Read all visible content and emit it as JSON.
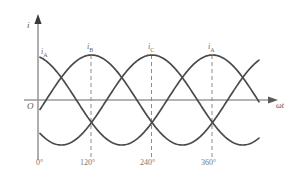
{
  "figure": {
    "title": "",
    "axes": {
      "y_axis_label": "i",
      "x_axis_label": "ωt",
      "origin_label": "O"
    },
    "curve_labels": [
      {
        "text": "i",
        "sub": "A"
      },
      {
        "text": "i",
        "sub": "B"
      },
      {
        "text": "i",
        "sub": "C"
      },
      {
        "text": "i",
        "sub": "A"
      }
    ],
    "tick_labels": [
      "0°",
      "120°",
      "240°",
      "360°"
    ],
    "colors": {
      "curve": "#4a4a4a",
      "axis": "#9a9a9a",
      "dashed": "#8c8c8c",
      "text": "#6a6a6a",
      "background": "#ffffff"
    }
  },
  "chart_data": {
    "type": "line",
    "xlabel": "ωt",
    "ylabel": "i",
    "xlim": [
      -20,
      420
    ],
    "ylim": [
      -1.15,
      1.15
    ],
    "grid": false,
    "legend": "inline-curve-labels",
    "x_ticks": [
      0,
      120,
      240,
      360
    ],
    "x_tick_labels": [
      "0°",
      "120°",
      "240°",
      "360°"
    ],
    "amplitude": 1.0,
    "period_deg": 360,
    "series": [
      {
        "name": "i_A",
        "phase_deg": 90,
        "peak_at_deg": [
          0,
          360
        ],
        "values_desc": "sin(wt + 90)"
      },
      {
        "name": "i_B",
        "phase_deg": -30,
        "peak_at_deg": [
          120
        ],
        "values_desc": "sin(wt - 30)"
      },
      {
        "name": "i_C",
        "phase_deg": -150,
        "peak_at_deg": [
          240
        ],
        "values_desc": "sin(wt - 150)"
      }
    ],
    "annotations": [
      {
        "label": "i_A",
        "x_deg": 0,
        "y": 0.78
      },
      {
        "label": "i_B",
        "x_deg": 120,
        "y": 1.0
      },
      {
        "label": "i_C",
        "x_deg": 240,
        "y": 1.0
      },
      {
        "label": "i_A",
        "x_deg": 360,
        "y": 1.0
      }
    ]
  }
}
